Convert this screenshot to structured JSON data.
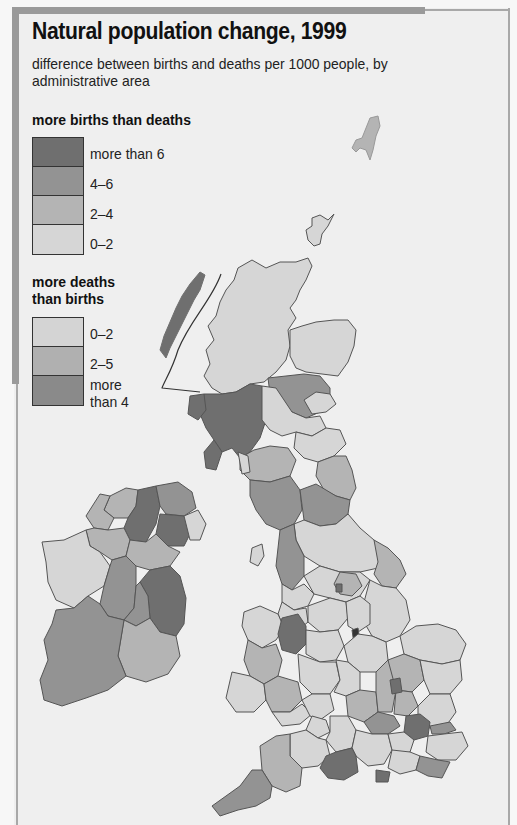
{
  "map": {
    "title": "Natural population change, 1999",
    "subtitle": "difference between births and deaths per 1000 people, by administrative area",
    "region": "United Kingdom and Ireland",
    "legend": {
      "births_heading": "more births than deaths",
      "births_classes": [
        {
          "label": "more than 6",
          "color": "#6f6f6f"
        },
        {
          "label": "4–6",
          "color": "#939393"
        },
        {
          "label": "2–4",
          "color": "#b4b4b4"
        },
        {
          "label": "0–2",
          "color": "#d6d6d6"
        }
      ],
      "deaths_heading_line1": "more deaths",
      "deaths_heading_line2": "than births",
      "deaths_classes": [
        {
          "label": "0–2",
          "color": "#d4d4d4"
        },
        {
          "label": "2–5",
          "color": "#b0b0b0"
        },
        {
          "label_line1": "more",
          "label_line2": "than 4",
          "color": "#8a8a8a"
        }
      ]
    },
    "colors": {
      "background": "#efefef",
      "border": "#9a9a9a",
      "outline": "#555555",
      "sea": "#efefef"
    }
  }
}
